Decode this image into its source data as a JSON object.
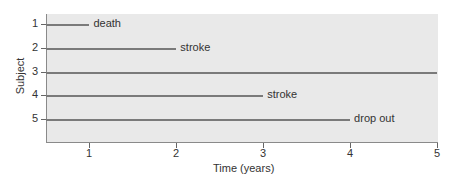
{
  "chart_data": {
    "type": "line",
    "subtype": "swimmer / survival timeline",
    "title": "",
    "xlabel": "Time (years)",
    "ylabel": "Subject",
    "xlim": [
      0.5,
      5
    ],
    "x_ticks": [
      1,
      2,
      3,
      4,
      5
    ],
    "y_ticks": [
      1,
      2,
      3,
      4,
      5
    ],
    "grid": false,
    "background": "#e9e9e9",
    "line_color": "#7a7a7a",
    "subjects": [
      {
        "id": 1,
        "start": 0.5,
        "end": 1.0,
        "event": "death"
      },
      {
        "id": 2,
        "start": 0.5,
        "end": 2.0,
        "event": "stroke"
      },
      {
        "id": 3,
        "start": 0.5,
        "end": 5.0,
        "event": ""
      },
      {
        "id": 4,
        "start": 0.5,
        "end": 3.0,
        "event": "stroke"
      },
      {
        "id": 5,
        "start": 0.5,
        "end": 4.0,
        "event": "drop out"
      }
    ]
  }
}
